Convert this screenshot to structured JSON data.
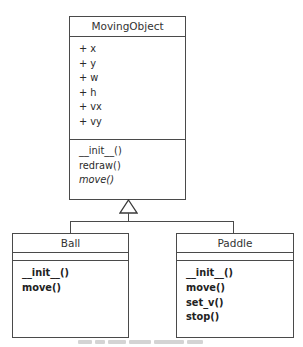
{
  "diagram": {
    "type": "uml-class-diagram",
    "parent": {
      "name": "MovingObject",
      "attributes": [
        "+ x",
        "+ y",
        "+ w",
        "+ h",
        "+ vx",
        "+ vy"
      ],
      "methods": [
        {
          "label": "__init__()",
          "abstract": false
        },
        {
          "label": "redraw()",
          "abstract": false
        },
        {
          "label": "move()",
          "abstract": true
        }
      ]
    },
    "children": [
      {
        "name": "Ball",
        "attributes": [],
        "methods": [
          "__init__()",
          "move()"
        ]
      },
      {
        "name": "Paddle",
        "attributes": [],
        "methods": [
          "__init__()",
          "move()",
          "set_v()",
          "stop()"
        ]
      }
    ],
    "relationship": "generalization (inheritance)",
    "caption": ""
  },
  "colors": {
    "line": "#4a4a4a",
    "background": "#ffffff",
    "text": "#2a2a2a"
  }
}
